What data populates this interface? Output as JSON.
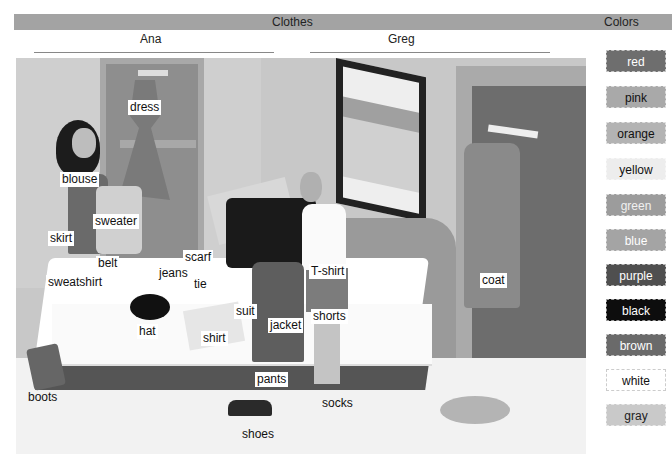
{
  "header": {
    "clothes_title": "Clothes",
    "colors_title": "Colors"
  },
  "people": [
    {
      "name": "Ana"
    },
    {
      "name": "Greg"
    }
  ],
  "labels": {
    "dress": "dress",
    "blouse": "blouse",
    "sweater": "sweater",
    "skirt": "skirt",
    "belt": "belt",
    "scarf": "scarf",
    "jeans": "jeans",
    "tie": "tie",
    "sweatshirt": "sweatshirt",
    "hat": "hat",
    "suit": "suit",
    "jacket": "jacket",
    "shirt": "shirt",
    "t_shirt": "T-shirt",
    "shorts": "shorts",
    "pants": "pants",
    "socks": "socks",
    "shoes": "shoes",
    "boots": "boots",
    "coat": "coat"
  },
  "colors": [
    {
      "label": "red",
      "bg": "#6e6e6e",
      "fg": "#ffffff"
    },
    {
      "label": "pink",
      "bg": "#a9a9a9",
      "fg": "#111111"
    },
    {
      "label": "orange",
      "bg": "#b3b3b3",
      "fg": "#111111"
    },
    {
      "label": "yellow",
      "bg": "#ededed",
      "fg": "#111111"
    },
    {
      "label": "green",
      "bg": "#9c9c9c",
      "fg": "#f0f0f0"
    },
    {
      "label": "blue",
      "bg": "#a4a4a4",
      "fg": "#ffffff"
    },
    {
      "label": "purple",
      "bg": "#4f4f4f",
      "fg": "#ffffff"
    },
    {
      "label": "black",
      "bg": "#0d0d0d",
      "fg": "#ffffff"
    },
    {
      "label": "brown",
      "bg": "#6a6a6a",
      "fg": "#ffffff"
    },
    {
      "label": "white",
      "bg": "#ffffff",
      "fg": "#111111"
    },
    {
      "label": "gray",
      "bg": "#c9c9c9",
      "fg": "#222222"
    }
  ]
}
